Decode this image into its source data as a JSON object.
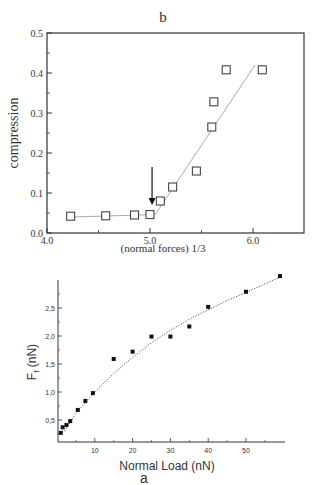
{
  "chart_data": [
    {
      "type": "scatter",
      "panel_label": "b",
      "title": "b",
      "xlabel": "(normal forces) 1/3",
      "ylabel": "compression",
      "xlim": [
        4.0,
        6.5
      ],
      "ylim": [
        0.0,
        0.5
      ],
      "xticks": [
        "4.0",
        "5.0",
        "6.0"
      ],
      "yticks": [
        "0.0",
        "0.1",
        "0.2",
        "0.3",
        "0.4",
        "0.5"
      ],
      "grid": false,
      "marker": "open-square",
      "series": [
        {
          "name": "data",
          "x": [
            4.23,
            4.57,
            4.85,
            5.0,
            5.1,
            5.22,
            5.45,
            5.6,
            5.62,
            5.74,
            6.09
          ],
          "y": [
            0.042,
            0.043,
            0.045,
            0.046,
            0.08,
            0.115,
            0.155,
            0.265,
            0.328,
            0.408,
            0.408
          ]
        }
      ],
      "fit_lines": [
        {
          "x": [
            4.23,
            5.05
          ],
          "y": [
            0.04,
            0.046
          ]
        },
        {
          "x": [
            5.05,
            6.02
          ],
          "y": [
            0.046,
            0.42
          ]
        }
      ],
      "annotations": [
        {
          "type": "arrow",
          "x": 5.02,
          "y_from": 0.165,
          "y_to": 0.07,
          "direction": "down"
        }
      ]
    },
    {
      "type": "scatter",
      "panel_label": "a",
      "title": "",
      "xlabel": "Normal Load (nN)",
      "ylabel": "F_f (nN)",
      "xlim": [
        0,
        60
      ],
      "ylim": [
        0,
        3.0
      ],
      "xticks": [
        "10",
        "20",
        "30",
        "40",
        "50"
      ],
      "yticks": [
        "0,5",
        "1,0",
        "1,5",
        "2,0",
        "2,5"
      ],
      "grid": false,
      "marker": "filled-square",
      "series": [
        {
          "name": "data",
          "x": [
            1,
            1.5,
            2.5,
            3.5,
            5.5,
            7.5,
            9.5,
            15,
            20,
            25,
            30,
            35,
            40,
            50,
            59
          ],
          "y": [
            0.27,
            0.37,
            0.41,
            0.48,
            0.68,
            0.84,
            0.98,
            1.59,
            1.72,
            1.99,
            1.99,
            2.17,
            2.52,
            2.79,
            3.07
          ]
        }
      ],
      "fit_line": {
        "style": "dotted",
        "x": [
          2,
          5,
          10,
          15,
          20,
          25,
          30,
          35,
          40,
          45,
          50,
          55,
          59
        ],
        "y": [
          0.3,
          0.62,
          1.0,
          1.33,
          1.62,
          1.88,
          2.1,
          2.3,
          2.47,
          2.63,
          2.78,
          2.93,
          3.05
        ]
      }
    }
  ],
  "labels": {
    "b_title": "b",
    "b_xlabel": "(normal forces) 1/3",
    "b_ylabel": "compression",
    "a_xlabel": "Normal Load (nN)",
    "a_ylabel_main": "F",
    "a_ylabel_sub": "f",
    "a_ylabel_rest": " (nN)",
    "a_caption": "a"
  }
}
